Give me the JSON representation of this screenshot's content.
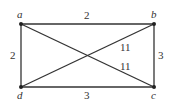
{
  "graph": {
    "vertices": [
      {
        "id": "a",
        "label": "a",
        "x": 21,
        "y": 24
      },
      {
        "id": "b",
        "label": "b",
        "x": 154,
        "y": 24
      },
      {
        "id": "c",
        "label": "c",
        "x": 154,
        "y": 87
      },
      {
        "id": "d",
        "label": "d",
        "x": 21,
        "y": 87
      }
    ],
    "edges": [
      {
        "from": "a",
        "to": "b",
        "weight": "2"
      },
      {
        "from": "b",
        "to": "c",
        "weight": "3"
      },
      {
        "from": "c",
        "to": "d",
        "weight": "3"
      },
      {
        "from": "d",
        "to": "a",
        "weight": "2"
      },
      {
        "from": "a",
        "to": "c",
        "weight": "11"
      },
      {
        "from": "b",
        "to": "d",
        "weight": "11"
      }
    ]
  }
}
